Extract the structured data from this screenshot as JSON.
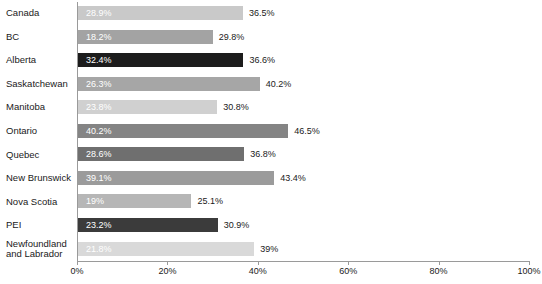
{
  "chart_data": {
    "type": "bar",
    "orientation": "horizontal",
    "title": "",
    "subtitle": "",
    "xlabel": "",
    "ylabel": "",
    "xlim": [
      0,
      100
    ],
    "grid": false,
    "legend": "none",
    "axis_tick_labels": [
      "0%",
      "20%",
      "40%",
      "60%",
      "80%",
      "100%"
    ],
    "axis_tick_values": [
      0,
      20,
      40,
      60,
      80,
      100
    ],
    "categories": [
      "Canada",
      "BC",
      "Alberta",
      "Saskatchewan",
      "Manitoba",
      "Ontario",
      "Quebec",
      "New Brunswick",
      "Nova Scotia",
      "PEI",
      "Newfoundland and Labrador"
    ],
    "series": [
      {
        "name": "inner-value",
        "values": [
          28.9,
          18.2,
          32.4,
          26.3,
          23.8,
          40.2,
          28.6,
          39.1,
          19,
          23.2,
          21.8
        ],
        "labels": [
          "28.9%",
          "18.2%",
          "32.4%",
          "26.3%",
          "23.8%",
          "40.2%",
          "28.6%",
          "39.1%",
          "19%",
          "23.2%",
          "21.8%"
        ]
      },
      {
        "name": "bar-length-value",
        "values": [
          36.5,
          29.8,
          36.6,
          40.2,
          30.8,
          46.5,
          36.8,
          43.4,
          25.1,
          30.9,
          39
        ],
        "labels": [
          "36.5%",
          "29.8%",
          "36.6%",
          "40.2%",
          "30.8%",
          "46.5%",
          "36.8%",
          "43.4%",
          "25.1%",
          "30.9%",
          "39%"
        ]
      }
    ],
    "bar_colors": [
      "#c9c9c9",
      "#a3a3a3",
      "#1c1c1c",
      "#a6a6a6",
      "#d0d0d0",
      "#848484",
      "#6f6f6f",
      "#9b9b9b",
      "#b6b6b6",
      "#3b3b3b",
      "#d9d9d9"
    ],
    "axis_color": "#9a9a9a",
    "inner_label_color": "#ffffff",
    "end_label_color": "#1a1a1a",
    "background_color": "#ffffff"
  },
  "rows": [
    {
      "category": "Canada",
      "inner": "28.9%",
      "end": "36.5%",
      "length": 36.5,
      "color": "#c9c9c9"
    },
    {
      "category": "BC",
      "inner": "18.2%",
      "end": "29.8%",
      "length": 29.8,
      "color": "#a3a3a3"
    },
    {
      "category": "Alberta",
      "inner": "32.4%",
      "end": "36.6%",
      "length": 36.6,
      "color": "#1c1c1c"
    },
    {
      "category": "Saskatchewan",
      "inner": "26.3%",
      "end": "40.2%",
      "length": 40.2,
      "color": "#a6a6a6"
    },
    {
      "category": "Manitoba",
      "inner": "23.8%",
      "end": "30.8%",
      "length": 30.8,
      "color": "#d0d0d0"
    },
    {
      "category": "Ontario",
      "inner": "40.2%",
      "end": "46.5%",
      "length": 46.5,
      "color": "#848484"
    },
    {
      "category": "Quebec",
      "inner": "28.6%",
      "end": "36.8%",
      "length": 36.8,
      "color": "#6f6f6f"
    },
    {
      "category": "New Brunswick",
      "inner": "39.1%",
      "end": "43.4%",
      "length": 43.4,
      "color": "#9b9b9b"
    },
    {
      "category": "Nova Scotia",
      "inner": "19%",
      "end": "25.1%",
      "length": 25.1,
      "color": "#b6b6b6"
    },
    {
      "category": "PEI",
      "inner": "23.2%",
      "end": "30.9%",
      "length": 30.9,
      "color": "#3b3b3b"
    },
    {
      "category": "Newfoundland and Labrador",
      "inner": "21.8%",
      "end": "39%",
      "length": 39.0,
      "color": "#d9d9d9"
    }
  ],
  "axis": {
    "ticks": [
      {
        "label": "0%",
        "value": 0
      },
      {
        "label": "20%",
        "value": 20
      },
      {
        "label": "40%",
        "value": 40
      },
      {
        "label": "60%",
        "value": 60
      },
      {
        "label": "80%",
        "value": 80
      },
      {
        "label": "100%",
        "value": 100
      }
    ]
  }
}
